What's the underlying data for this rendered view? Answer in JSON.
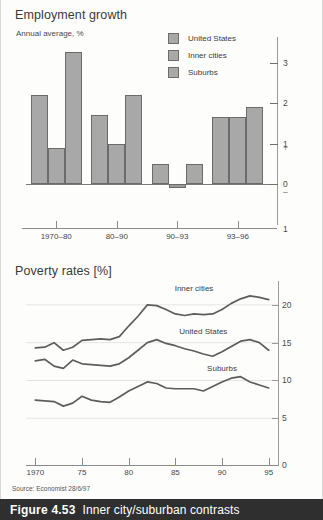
{
  "figure": {
    "number": "Figure 4.53",
    "title": "Inner city/suburban contrasts",
    "source": "Source: Economist 28/6/97"
  },
  "bar_chart_meta": {
    "title": "Employment growth",
    "subtitle": "Annual average, %",
    "legend": [
      {
        "label": "United States",
        "color": "#a8a8a8"
      },
      {
        "label": "Inner cities",
        "color": "#a8a8a8"
      },
      {
        "label": "Suburbs",
        "color": "#a8a8a8"
      }
    ],
    "axis_sign_plus": "+",
    "axis_sign_minus": "–",
    "axis_below_zero_label": "1"
  },
  "line_chart_meta": {
    "title": "Poverty rates [%]"
  },
  "chart_data": [
    {
      "type": "bar",
      "title": "Employment growth",
      "subtitle": "Annual average, %",
      "xlabel": "",
      "ylabel": "Annual average, %",
      "categories": [
        "1970–80",
        "80–90",
        "90–93",
        "93–96"
      ],
      "series": [
        {
          "name": "United States",
          "values": [
            2.2,
            1.7,
            0.5,
            1.65
          ]
        },
        {
          "name": "Inner cities",
          "values": [
            0.9,
            1.0,
            -0.1,
            1.65
          ]
        },
        {
          "name": "Suburbs",
          "values": [
            3.25,
            2.2,
            0.5,
            1.9
          ]
        }
      ],
      "ylim": [
        -1,
        3.6
      ],
      "yticks": [
        3,
        2,
        1,
        0,
        -1
      ],
      "ytick_labels": [
        "3",
        "2",
        "1",
        "0",
        "1"
      ],
      "grid": false,
      "legend_position": "top-center"
    },
    {
      "type": "line",
      "title": "Poverty rates [%]",
      "xlabel": "",
      "ylabel": "%",
      "xlim": [
        1969,
        1996
      ],
      "ylim": [
        0,
        22.5
      ],
      "yticks": [
        5,
        10,
        15,
        20
      ],
      "ytick_labels": [
        "5",
        "10",
        "15",
        "20"
      ],
      "xticks": [
        1970,
        1975,
        1980,
        1985,
        1990,
        1995
      ],
      "xtick_labels": [
        "1970",
        "75",
        "80",
        "85",
        "90",
        "95"
      ],
      "grid": true,
      "legend_position": "inline-annotations",
      "x": [
        1970,
        1971,
        1972,
        1973,
        1974,
        1975,
        1976,
        1977,
        1978,
        1979,
        1980,
        1981,
        1982,
        1983,
        1984,
        1985,
        1986,
        1987,
        1988,
        1989,
        1990,
        1991,
        1992,
        1993,
        1994,
        1995
      ],
      "series": [
        {
          "name": "Inner cities",
          "values": [
            14.3,
            14.4,
            15.0,
            14.0,
            14.4,
            15.3,
            15.4,
            15.5,
            15.4,
            15.8,
            17.2,
            18.5,
            20.0,
            19.9,
            19.4,
            18.8,
            18.6,
            18.8,
            18.7,
            18.8,
            19.4,
            20.2,
            20.8,
            21.2,
            21.0,
            20.7
          ]
        },
        {
          "name": "United States",
          "values": [
            12.6,
            12.8,
            11.9,
            11.6,
            12.7,
            12.2,
            12.1,
            12.0,
            11.9,
            12.2,
            13.0,
            14.0,
            15.0,
            15.4,
            14.9,
            14.6,
            14.2,
            13.9,
            13.5,
            13.2,
            13.8,
            14.5,
            15.2,
            15.4,
            15.0,
            14.0
          ]
        },
        {
          "name": "Suburbs",
          "values": [
            7.4,
            7.3,
            7.2,
            6.6,
            7.0,
            7.9,
            7.4,
            7.2,
            7.1,
            7.8,
            8.6,
            9.2,
            9.8,
            9.6,
            9.0,
            8.9,
            8.9,
            8.9,
            8.6,
            9.2,
            9.8,
            10.3,
            10.5,
            9.8,
            9.4,
            9.0
          ]
        }
      ],
      "annotations": [
        {
          "text": "Inner cities",
          "x": 1987,
          "y": 22.3
        },
        {
          "text": "United States",
          "x": 1988,
          "y": 16.6
        },
        {
          "text": "Suburbs",
          "x": 1990,
          "y": 11.6
        }
      ]
    }
  ]
}
